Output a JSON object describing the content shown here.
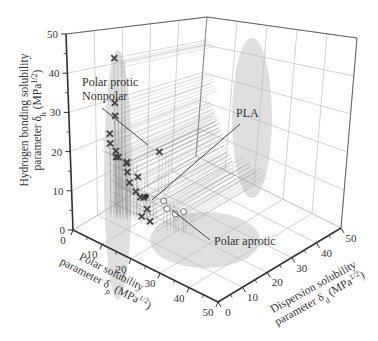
{
  "chart_data": {
    "type": "scatter3d",
    "title": "",
    "axes": {
      "x": {
        "name": "Polar solubility parameter δp (MPa^1/2)",
        "label_line1": "Polar solubility",
        "label_line2": "parameter δ",
        "sub": "p",
        "unit": " (MPa",
        "sup": "1/2",
        "close": ")",
        "range": [
          0,
          50
        ],
        "ticks": [
          0,
          10,
          20,
          30,
          40,
          50
        ]
      },
      "y": {
        "name": "Dispersion solubility parameter δd (MPa^1/2)",
        "label_line1": "Dispersion solubility",
        "label_line2": "parameter δ",
        "sub": "d",
        "unit": " (MPa",
        "sup": "1/2",
        "close": ")",
        "range": [
          0,
          50
        ],
        "ticks": [
          0,
          10,
          20,
          30,
          40,
          50
        ]
      },
      "z": {
        "name": "Hydrogen bonding solubility parameter δh (MPa^1/2)",
        "label_line1": "Hydrogen bonding solubility",
        "label_line2": "parameter δ",
        "sub": "h",
        "unit": " (MPa",
        "sup": "1/2",
        "close": ")",
        "range": [
          0,
          50
        ],
        "ticks": [
          0,
          10,
          20,
          30,
          40,
          50
        ]
      }
    },
    "grid": true,
    "legend": null,
    "annotations": [
      {
        "text_lines": [
          "Polar protic",
          "Nonpolar"
        ],
        "x": 82,
        "y": 86,
        "pointer_from": [
          102,
          108
        ],
        "pointer_to": [
          148,
          145
        ]
      },
      {
        "text_lines": [
          "PLA"
        ],
        "x": 236,
        "y": 117,
        "pointer_from": [
          240,
          124
        ],
        "pointer_to": [
          152,
          200
        ]
      },
      {
        "text_lines": [
          "Polar aprotic"
        ],
        "x": 214,
        "y": 245,
        "pointer_from": [
          210,
          240
        ],
        "pointer_to": [
          172,
          210
        ]
      }
    ],
    "series": [
      {
        "name": "Polar protic / Nonpolar solvents",
        "marker": "x",
        "points": [
          {
            "dp": 1,
            "dd": 16,
            "dh": 42
          },
          {
            "dp": 2,
            "dd": 15,
            "dh": 30
          },
          {
            "dp": 3,
            "dd": 14,
            "dh": 27
          },
          {
            "dp": 2,
            "dd": 13,
            "dh": 22
          },
          {
            "dp": 3,
            "dd": 12,
            "dh": 20
          },
          {
            "dp": 4,
            "dd": 13,
            "dh": 18
          },
          {
            "dp": 5,
            "dd": 12,
            "dh": 17
          },
          {
            "dp": 4,
            "dd": 14,
            "dh": 16
          },
          {
            "dp": 6,
            "dd": 15,
            "dh": 15
          },
          {
            "dp": 5,
            "dd": 16,
            "dh": 14
          },
          {
            "dp": 7,
            "dd": 14,
            "dh": 13
          },
          {
            "dp": 8,
            "dd": 17,
            "dh": 11
          },
          {
            "dp": 6,
            "dd": 16,
            "dh": 9
          },
          {
            "dp": 9,
            "dd": 15,
            "dh": 8
          },
          {
            "dp": 10,
            "dd": 17,
            "dh": 6
          },
          {
            "dp": 8,
            "dd": 18,
            "dh": 5
          },
          {
            "dp": 12,
            "dd": 16,
            "dh": 4
          },
          {
            "dp": 11,
            "dd": 15,
            "dh": 2
          },
          {
            "dp": 13,
            "dd": 16,
            "dh": 1
          },
          {
            "dp": 4,
            "dd": 30,
            "dh": 12
          }
        ]
      },
      {
        "name": "Polar aprotic solvents",
        "marker": "circle",
        "points": [
          {
            "dp": 16,
            "dd": 18,
            "dh": 7
          },
          {
            "dp": 18,
            "dd": 17,
            "dh": 6
          },
          {
            "dp": 20,
            "dd": 18,
            "dh": 5
          },
          {
            "dp": 22,
            "dd": 19,
            "dh": 6
          }
        ]
      },
      {
        "name": "PLA",
        "marker": "dot",
        "points": [
          {
            "dp": 10,
            "dd": 18,
            "dh": 6
          }
        ]
      }
    ],
    "ellipsoids": [
      {
        "name": "left-shadow",
        "cx": 118,
        "cy": 175,
        "rx": 14,
        "ry": 125
      },
      {
        "name": "right-shadow",
        "cx": 252,
        "cy": 118,
        "rx": 20,
        "ry": 80
      },
      {
        "name": "floor-shadow",
        "cx": 205,
        "cy": 240,
        "rx": 55,
        "ry": 28
      }
    ]
  },
  "geometry": {
    "origin": [
      73,
      230
    ],
    "dp_end": [
      218,
      302
    ],
    "dd_end_front": [
      341,
      228
    ],
    "back_floor": [
      196,
      156
    ],
    "origin_top": [
      66,
      34
    ],
    "back_top": [
      207,
      17
    ],
    "right_top": [
      357,
      38
    ]
  },
  "colors": {
    "axis": "#333333",
    "grid": "#b5b5b5",
    "marker": "#444444",
    "projection": "#8a8a8a",
    "shadow": "#d4d4d4",
    "annot_line": "#444444"
  }
}
